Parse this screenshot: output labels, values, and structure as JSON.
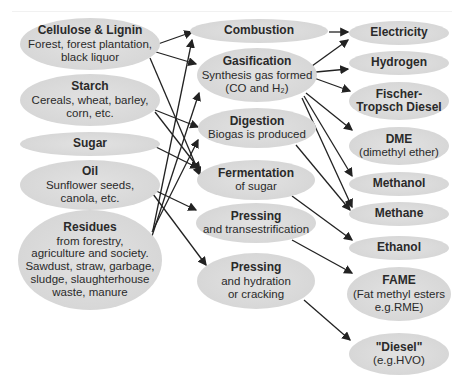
{
  "diagram": {
    "colors": {
      "node_fill": "#d8d8d8",
      "edge": "#222222",
      "text": "#2a2a2a"
    },
    "sources": [
      {
        "id": "cellulose",
        "title": "Cellulose & Lignin",
        "lines": [
          "Forest, forest plantation,",
          "black liquor"
        ]
      },
      {
        "id": "starch",
        "title": "Starch",
        "lines": [
          "Cereals, wheat, barley,",
          "corn, etc."
        ]
      },
      {
        "id": "sugar",
        "title": "Sugar",
        "lines": []
      },
      {
        "id": "oil",
        "title": "Oil",
        "lines": [
          "Sunflower seeds,",
          "canola, etc."
        ]
      },
      {
        "id": "residues",
        "title": "Residues",
        "lines": [
          "from forestry,",
          "agriculture and society.",
          "Sawdust, straw, garbage,",
          "sludge, slaughterhouse",
          "waste, manure"
        ]
      }
    ],
    "processes": [
      {
        "id": "combustion",
        "title": "Combustion",
        "lines": []
      },
      {
        "id": "gasification",
        "title": "Gasification",
        "lines": [
          "Synthesis gas formed",
          "(CO and H₂)"
        ]
      },
      {
        "id": "digestion",
        "title": "Digestion",
        "lines": [
          "Biogas is produced"
        ]
      },
      {
        "id": "fermentation",
        "title": "Fermentation",
        "lines": [
          "of sugar"
        ]
      },
      {
        "id": "pressing1",
        "title": "Pressing",
        "lines": [
          "and transestrification"
        ]
      },
      {
        "id": "pressing2",
        "title": "Pressing",
        "lines": [
          "and hydration",
          "or cracking"
        ]
      }
    ],
    "products": [
      {
        "id": "electricity",
        "title": "Electricity",
        "lines": []
      },
      {
        "id": "hydrogen",
        "title": "Hydrogen",
        "lines": []
      },
      {
        "id": "ft_diesel",
        "title": "Fischer-",
        "lines": [
          "Tropsch Diesel"
        ]
      },
      {
        "id": "dme",
        "title": "DME",
        "lines": [
          "(dimethyl ether)"
        ]
      },
      {
        "id": "methanol",
        "title": "Methanol",
        "lines": []
      },
      {
        "id": "methane",
        "title": "Methane",
        "lines": []
      },
      {
        "id": "ethanol",
        "title": "Ethanol",
        "lines": []
      },
      {
        "id": "fame",
        "title": "FAME",
        "lines": [
          "(Fat methyl esters",
          "e.g.RME)"
        ]
      },
      {
        "id": "diesel",
        "title": "\"Diesel\"",
        "lines": [
          "(e.g.HVO)"
        ]
      }
    ],
    "edges": [
      [
        "cellulose",
        "combustion"
      ],
      [
        "cellulose",
        "gasification"
      ],
      [
        "cellulose",
        "fermentation"
      ],
      [
        "starch",
        "digestion"
      ],
      [
        "starch",
        "fermentation"
      ],
      [
        "sugar",
        "fermentation"
      ],
      [
        "oil",
        "pressing1"
      ],
      [
        "oil",
        "pressing2"
      ],
      [
        "residues",
        "gasification"
      ],
      [
        "residues",
        "digestion"
      ],
      [
        "residues",
        "combustion"
      ],
      [
        "combustion",
        "electricity"
      ],
      [
        "gasification",
        "electricity"
      ],
      [
        "gasification",
        "hydrogen"
      ],
      [
        "gasification",
        "ft_diesel"
      ],
      [
        "gasification",
        "dme"
      ],
      [
        "gasification",
        "methanol"
      ],
      [
        "gasification",
        "methane"
      ],
      [
        "digestion",
        "methane"
      ],
      [
        "fermentation",
        "ethanol"
      ],
      [
        "pressing1",
        "fame"
      ],
      [
        "pressing2",
        "diesel"
      ]
    ]
  }
}
